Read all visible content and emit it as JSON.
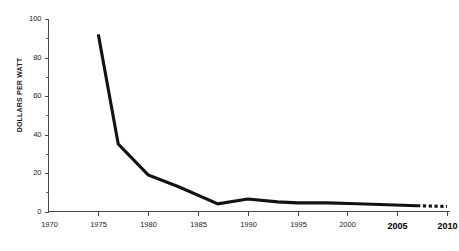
{
  "chart_data": {
    "type": "line",
    "title": "",
    "subtitle": "",
    "xlabel": "",
    "ylabel": "DOLLARS PER WATT",
    "xlim": [
      1970,
      2010
    ],
    "ylim": [
      0,
      100
    ],
    "grid": false,
    "legend": "none",
    "x_ticks": [
      1970,
      1975,
      1980,
      1985,
      1990,
      1995,
      2000,
      2005,
      2010
    ],
    "x_tick_labels": [
      "1970",
      "1975",
      "1980",
      "1985",
      "1990",
      "1995",
      "2000",
      "2005",
      "2010"
    ],
    "x_tick_emphasis": [
      false,
      false,
      false,
      false,
      false,
      false,
      false,
      true,
      true
    ],
    "y_ticks_major": [
      0,
      20,
      40,
      60,
      80,
      100
    ],
    "y_tick_labels": [
      "0",
      "20",
      "40",
      "60",
      "80",
      "100"
    ],
    "y_ticks_minor": [
      10,
      30,
      50,
      70,
      90
    ],
    "series": [
      {
        "name": "Solar module price",
        "style": "solid",
        "color": "#121212",
        "x": [
          1975,
          1977,
          1980,
          1983,
          1987,
          1990,
          1993,
          1995,
          1998,
          2001,
          2004,
          2007
        ],
        "values": [
          92,
          35,
          19,
          13,
          4,
          6.5,
          5,
          4.5,
          4.5,
          4,
          3.5,
          3
        ]
      },
      {
        "name": "Projected price",
        "style": "dashed",
        "color": "#121212",
        "x": [
          2007,
          2010
        ],
        "values": [
          3,
          2.6
        ]
      }
    ]
  },
  "figure": {
    "background_color": "#ffffff",
    "axis_color": "#4a4a4a",
    "line_color": "#121212"
  }
}
